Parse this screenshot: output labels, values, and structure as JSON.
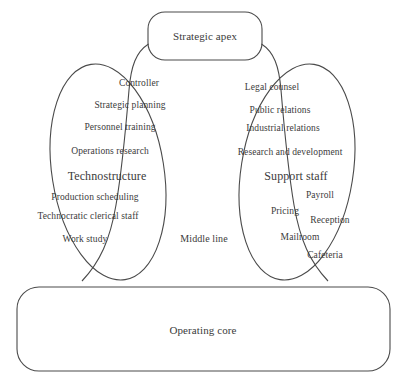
{
  "diagram": {
    "ink_color": "#3b3b3b",
    "stroke_color": "#4a4a4a",
    "background": "#ffffff"
  },
  "strategic_apex": {
    "label": "Strategic apex",
    "x": 205,
    "y": 36
  },
  "middle_line": {
    "label": "Middle line",
    "x": 204,
    "y": 239
  },
  "operating_core": {
    "label": "Operating core",
    "x": 203,
    "y": 330
  },
  "technostructure": {
    "heading": "Technostructure",
    "heading_x": 107,
    "heading_y": 176,
    "items": [
      {
        "label": "Controller",
        "x": 139,
        "y": 84
      },
      {
        "label": "Strategic planning",
        "x": 130,
        "y": 106
      },
      {
        "label": "Personnel training",
        "x": 120,
        "y": 128
      },
      {
        "label": "Operations research",
        "x": 110,
        "y": 152
      },
      {
        "label": "Production scheduling",
        "x": 95,
        "y": 198
      },
      {
        "label": "Technocratic clerical staff",
        "x": 88,
        "y": 217
      },
      {
        "label": "Work study",
        "x": 85,
        "y": 240
      }
    ]
  },
  "support_staff": {
    "heading": "Support staff",
    "heading_x": 296,
    "heading_y": 176,
    "items": [
      {
        "label": "Legal counsel",
        "x": 272,
        "y": 88
      },
      {
        "label": "Public relations",
        "x": 280,
        "y": 111
      },
      {
        "label": "Industrial relations",
        "x": 283,
        "y": 129
      },
      {
        "label": "Research and development",
        "x": 290,
        "y": 153
      },
      {
        "label": "Payroll",
        "x": 320,
        "y": 196
      },
      {
        "label": "Pricing",
        "x": 285,
        "y": 212
      },
      {
        "label": "Reception",
        "x": 330,
        "y": 221
      },
      {
        "label": "Mailroom",
        "x": 300,
        "y": 238
      },
      {
        "label": "Cafeteria",
        "x": 325,
        "y": 256
      }
    ]
  }
}
